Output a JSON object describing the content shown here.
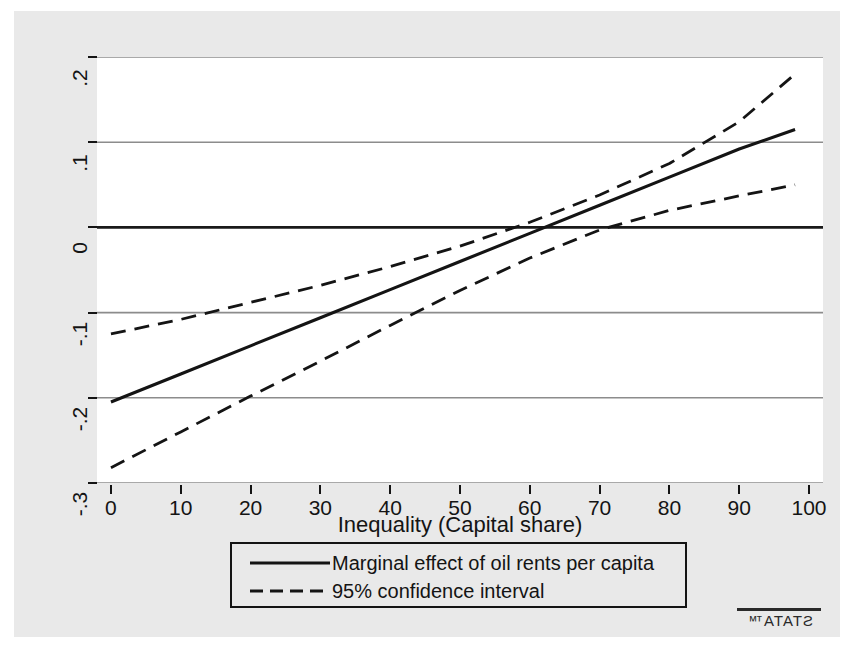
{
  "chart_data": {
    "type": "line",
    "title": "",
    "subtitle": "",
    "xlabel": "Inequality (Capital share)",
    "ylabel": "",
    "xlim": [
      -2,
      102
    ],
    "ylim": [
      -0.3,
      0.2
    ],
    "xticks": [
      0,
      10,
      20,
      30,
      40,
      50,
      60,
      70,
      80,
      90,
      100
    ],
    "xticklabels": [
      "0",
      "10",
      "20",
      "30",
      "40",
      "50",
      "60",
      "70",
      "80",
      "90",
      "100"
    ],
    "yticks": [
      0.2,
      0.1,
      0,
      -0.1,
      -0.2,
      -0.3
    ],
    "yticklabels": [
      ".2",
      ".1",
      "0",
      "-.1",
      "-.2",
      "-.3"
    ],
    "grid": "horizontal",
    "zero_line": true,
    "legend_position": "below-plot",
    "x": [
      0,
      10,
      20,
      30,
      40,
      50,
      60,
      70,
      80,
      90,
      98
    ],
    "series": [
      {
        "name": "Marginal effect of oil rents per capita",
        "style": "solid",
        "color": "#141414",
        "values": [
          -0.205,
          -0.172,
          -0.139,
          -0.106,
          -0.073,
          -0.04,
          -0.007,
          0.026,
          0.059,
          0.092,
          0.115
        ]
      },
      {
        "name": "95% confidence interval (upper)",
        "style": "dashed",
        "color": "#141414",
        "values": [
          -0.125,
          -0.108,
          -0.088,
          -0.068,
          -0.046,
          -0.022,
          0.006,
          0.038,
          0.075,
          0.124,
          0.18
        ]
      },
      {
        "name": "95% confidence interval (lower)",
        "style": "dashed",
        "color": "#141414",
        "values": [
          -0.282,
          -0.24,
          -0.198,
          -0.157,
          -0.115,
          -0.074,
          -0.036,
          -0.003,
          0.02,
          0.037,
          0.05
        ]
      }
    ],
    "legend_entries": [
      {
        "label": "Marginal effect of oil rents per capita",
        "style": "solid"
      },
      {
        "label": "95% confidence interval",
        "style": "dashed"
      }
    ],
    "annotations": {
      "zero_crossing_estimate_x": 62,
      "significant_above_x": 71
    }
  },
  "axis": {
    "x_title": "Inequality (Capital share)"
  },
  "legend": {
    "row1_label": "Marginal effect of oil rents per capita",
    "row2_label": "95% confidence interval"
  },
  "branding": {
    "logo_text": "STATA™"
  },
  "colors": {
    "graph_background": "#e9e9e9",
    "plot_background": "#ffffff",
    "line": "#141414",
    "gridline": "#8c8c8c",
    "zero_line": "#1a1a1a"
  }
}
